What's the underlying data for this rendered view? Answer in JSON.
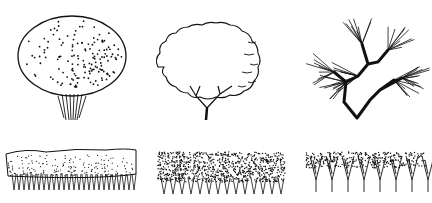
{
  "canvas": {
    "width": 432,
    "height": 203,
    "background": "#ffffff",
    "ink": "#111111"
  },
  "illustrations": [
    {
      "id": "round-dotted-tree",
      "label": "Round canopy tree with stippled shading",
      "x": 12,
      "y": 12,
      "w": 120,
      "h": 112
    },
    {
      "id": "cloud-outline-tree",
      "label": "Cloud-outline canopy tree with forked trunk",
      "x": 148,
      "y": 12,
      "w": 128,
      "h": 112
    },
    {
      "id": "branching-tree",
      "label": "Bare branching tree with radiating twigs",
      "x": 312,
      "y": 20,
      "w": 110,
      "h": 100
    },
    {
      "id": "trimmed-hedge",
      "label": "Trimmed hedge with stippled top and stems",
      "x": 2,
      "y": 140,
      "w": 138,
      "h": 55
    },
    {
      "id": "dense-hedge",
      "label": "Dense dark-leaved hedge row",
      "x": 155,
      "y": 150,
      "w": 132,
      "h": 48
    },
    {
      "id": "sparse-shrub-row",
      "label": "Sparse shrub row with V-shaped stems",
      "x": 302,
      "y": 150,
      "w": 128,
      "h": 48
    }
  ]
}
